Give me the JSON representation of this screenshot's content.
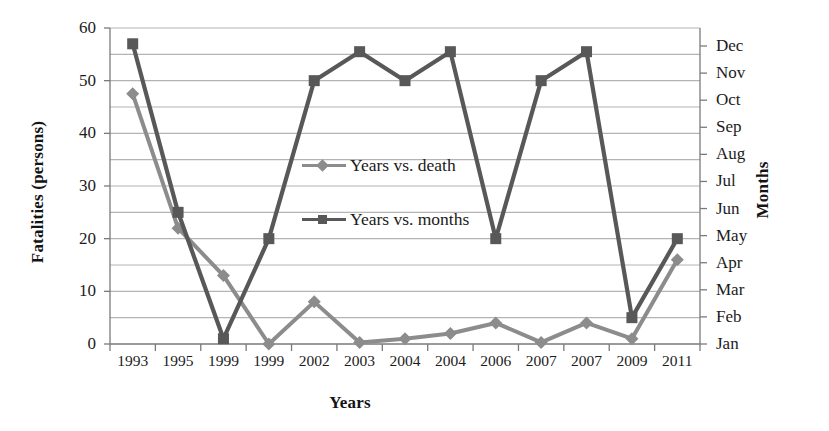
{
  "chart_data": {
    "type": "line",
    "title": "",
    "xlabel": "Years",
    "ylabel": "Fatalities (persons)",
    "y2label": "Months",
    "categories": [
      "1993",
      "1995",
      "1999",
      "1999",
      "2002",
      "2003",
      "2004",
      "2004",
      "2006",
      "2007",
      "2007",
      "2009",
      "2011"
    ],
    "ylim": [
      0,
      60
    ],
    "yticks": [
      0,
      10,
      20,
      30,
      40,
      50,
      60
    ],
    "ytick_labels": [
      "0",
      "10",
      "20",
      "30",
      "40",
      "50",
      "60"
    ],
    "y2tick_labels": [
      "Jan",
      "Feb",
      "Mar",
      "Apr",
      "May",
      "Jun",
      "Jul",
      "Aug",
      "Sep",
      "Oct",
      "Nov",
      "Dec"
    ],
    "grid": true,
    "grid_interval": 5,
    "legend_position": "center",
    "series": [
      {
        "name": "Years vs. death",
        "color": "#8c8c8c",
        "marker": "diamond",
        "values": [
          47.5,
          22,
          13,
          0,
          8,
          0.3,
          1,
          2,
          4,
          0.3,
          4,
          1,
          16
        ]
      },
      {
        "name": "Years vs. months",
        "color": "#585858",
        "marker": "square",
        "values": [
          57,
          25,
          1,
          20,
          50,
          55.5,
          50,
          55.5,
          20,
          50,
          55.5,
          5,
          20
        ]
      }
    ]
  },
  "legend": {
    "items": [
      {
        "label": "Years vs. death"
      },
      {
        "label": "Years vs. months"
      }
    ]
  },
  "axes": {
    "left_title": "Fatalities (persons)",
    "right_title": "Months",
    "bottom_title": "Years"
  }
}
